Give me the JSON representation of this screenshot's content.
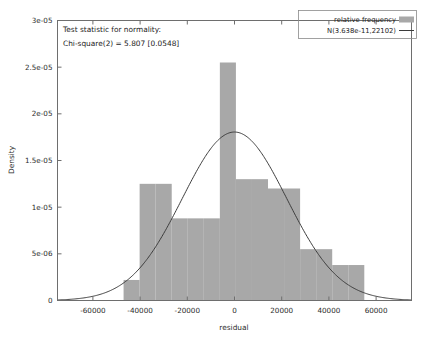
{
  "chart_data": {
    "type": "bar",
    "title": "",
    "xlabel": "residual",
    "ylabel": "Density",
    "xlim": [
      -75000,
      75000
    ],
    "ylim": [
      0,
      3e-05
    ],
    "grid": false,
    "legend_position": "top-right",
    "xticks": [
      -60000,
      -40000,
      -20000,
      0,
      20000,
      40000,
      60000
    ],
    "xtick_labels": [
      "-60000",
      "-40000",
      "-20000",
      "0",
      "20000",
      "40000",
      "60000"
    ],
    "yticks": [
      0,
      5e-06,
      1e-05,
      1.5e-05,
      2e-05,
      2.5e-05,
      3e-05
    ],
    "ytick_labels": [
      "0",
      "5e-06",
      "1e-05",
      "1.5e-05",
      "2e-05",
      "2.5e-05",
      "3e-05"
    ],
    "bin_width": 6800,
    "bin_edges": [
      -47000,
      -40200,
      -33400,
      -26600,
      -19800,
      -13000,
      -6200,
      600,
      7400,
      14200,
      21000,
      27800,
      34600,
      41400,
      48200,
      55000
    ],
    "bin_centers": [
      -43600,
      -36800,
      -30000,
      -23200,
      -16400,
      -9600,
      -2800,
      4000,
      10800,
      17600,
      24400,
      31200,
      38000,
      44800,
      51600
    ],
    "values": [
      2.2e-06,
      1.25e-05,
      1.25e-05,
      8.8e-06,
      8.8e-06,
      8.8e-06,
      2.55e-05,
      1.3e-05,
      1.3e-05,
      1.2e-05,
      1.2e-05,
      5.5e-06,
      5.5e-06,
      3.8e-06,
      3.8e-06
    ],
    "series": [
      {
        "name": "relative frequency",
        "type": "bar",
        "color": "#a8a8a8",
        "values": [
          2.2e-06,
          1.25e-05,
          1.25e-05,
          8.8e-06,
          8.8e-06,
          8.8e-06,
          2.55e-05,
          1.3e-05,
          1.3e-05,
          1.2e-05,
          1.2e-05,
          5.5e-06,
          5.5e-06,
          3.8e-06,
          3.8e-06
        ]
      },
      {
        "name": "N(3.638e-11,22102)",
        "type": "line",
        "color": "#3c3c3c",
        "distribution": "normal",
        "mean": 3.638e-11,
        "sd": 22102,
        "peak_density": 1.805e-05
      }
    ],
    "annotations": [
      "Test statistic for normality:",
      "Chi-square(2) = 5.807 [0.0548]"
    ],
    "statistics": {
      "test_name": "Chi-square",
      "degrees_of_freedom": 2,
      "statistic": 5.807,
      "p_value": 0.0548
    }
  },
  "legend": {
    "items": [
      {
        "label": "relative frequency",
        "marker": "swatch",
        "color": "#a8a8a8"
      },
      {
        "label": "N(3.638e-11,22102)",
        "marker": "line",
        "color": "#3c3c3c"
      }
    ]
  },
  "annotation": {
    "line1": "Test statistic for normality:",
    "line2": "Chi-square(2) = 5.807 [0.0548]"
  },
  "axes": {
    "x_title": "residual",
    "y_title": "Density"
  }
}
